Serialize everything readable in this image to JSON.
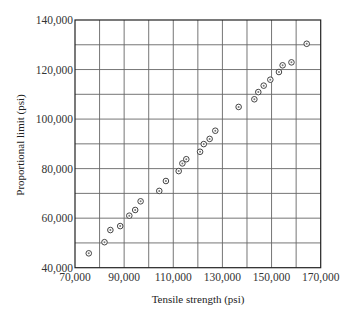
{
  "chart_data": {
    "type": "scatter",
    "title": "",
    "xlabel": "Tensile strength (psi)",
    "ylabel": "Proportional limit (psi)",
    "xlim": [
      70000,
      170000
    ],
    "ylim": [
      40000,
      140000
    ],
    "x_ticks": [
      70000,
      90000,
      110000,
      130000,
      150000,
      170000
    ],
    "x_tick_labels": [
      "70,000",
      "90,000",
      "110,000",
      "130,000",
      "150,000",
      "170,000"
    ],
    "y_ticks": [
      40000,
      60000,
      80000,
      100000,
      120000,
      140000
    ],
    "y_tick_labels": [
      "40,000",
      "60,000",
      "80,000",
      "100,000",
      "120,000",
      "140,000"
    ],
    "x_grid_step": 10000,
    "y_grid_step": 10000,
    "grid": true,
    "legend": null,
    "marker": "circle-dot",
    "series": [
      {
        "name": "specimens",
        "points": [
          {
            "x": 75600,
            "y": 45800
          },
          {
            "x": 82000,
            "y": 50300
          },
          {
            "x": 84400,
            "y": 55200
          },
          {
            "x": 88400,
            "y": 56800
          },
          {
            "x": 92100,
            "y": 61000
          },
          {
            "x": 94500,
            "y": 63300
          },
          {
            "x": 96700,
            "y": 66800
          },
          {
            "x": 104300,
            "y": 71000
          },
          {
            "x": 107000,
            "y": 75000
          },
          {
            "x": 112200,
            "y": 79000
          },
          {
            "x": 113700,
            "y": 82100
          },
          {
            "x": 115300,
            "y": 83800
          },
          {
            "x": 120900,
            "y": 86800
          },
          {
            "x": 122400,
            "y": 89900
          },
          {
            "x": 124800,
            "y": 92000
          },
          {
            "x": 127100,
            "y": 95300
          },
          {
            "x": 136600,
            "y": 104900
          },
          {
            "x": 143000,
            "y": 108000
          },
          {
            "x": 144600,
            "y": 110900
          },
          {
            "x": 146800,
            "y": 113500
          },
          {
            "x": 149500,
            "y": 115900
          },
          {
            "x": 153000,
            "y": 119000
          },
          {
            "x": 154500,
            "y": 121700
          },
          {
            "x": 158100,
            "y": 122900
          },
          {
            "x": 164300,
            "y": 130400
          }
        ]
      }
    ]
  },
  "labels": {
    "x_axis_title": "Tensile strength (psi)",
    "y_axis_title": "Proportional limit (psi)"
  },
  "colors": {
    "grid": "#666666",
    "frame": "#222222",
    "marker": "#444444",
    "background": "#ffffff"
  }
}
